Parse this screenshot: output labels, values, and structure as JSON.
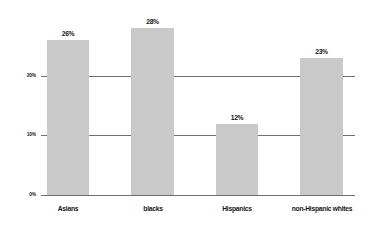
{
  "chart_data": {
    "type": "bar",
    "title": "",
    "subtitle": "",
    "xlabel": "",
    "ylabel": "",
    "categories": [
      "Asians",
      "blacks",
      "Hispanics",
      "non-Hispanic whites"
    ],
    "values": [
      26,
      28,
      12,
      23
    ],
    "value_labels": [
      "26%",
      "28%",
      "12%",
      "23%"
    ],
    "ylim": [
      0,
      30
    ],
    "yticks": [
      0,
      10,
      20
    ],
    "ytick_labels": [
      "0%",
      "10%",
      "20%"
    ],
    "grid": true,
    "grid_axis": "y",
    "legend": false,
    "legend_position": "none",
    "series": [
      {
        "name": "",
        "values": [
          26,
          28,
          12,
          23
        ]
      }
    ],
    "colors": {
      "bar_fill": "#c9c9c9",
      "axis_line": "#6e6e6e",
      "grid_line": "#6e6e6e",
      "label_text": "#141414",
      "background": "#ffffff"
    }
  }
}
